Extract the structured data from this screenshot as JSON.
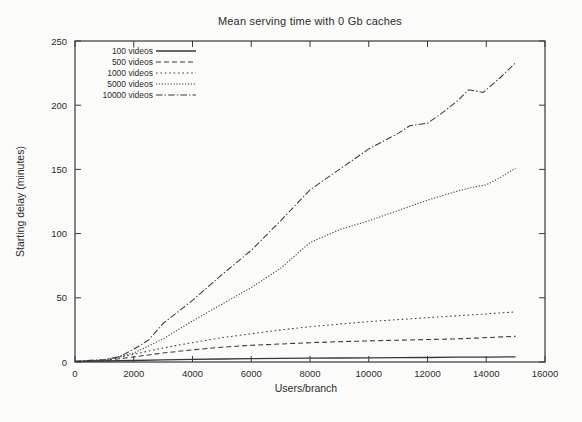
{
  "chart_data": {
    "type": "line",
    "title": "Mean serving time with 0 Gb caches",
    "xlabel": "Users/branch",
    "ylabel": "Starting delay (minutes)",
    "xlim": [
      0,
      16000
    ],
    "ylim": [
      0,
      250
    ],
    "x_ticks": [
      0,
      2000,
      4000,
      6000,
      8000,
      10000,
      12000,
      14000,
      16000
    ],
    "y_ticks": [
      0,
      50,
      100,
      150,
      200,
      250
    ],
    "grid": false,
    "legend_position": "top-left-inside",
    "line_color": "#383838",
    "text_color": "#2b2b2b",
    "series": [
      {
        "name": "100 videos",
        "dash": "solid",
        "points": [
          [
            0,
            0.5
          ],
          [
            1000,
            0.8
          ],
          [
            2000,
            1.2
          ],
          [
            3000,
            1.6
          ],
          [
            4000,
            2
          ],
          [
            5000,
            2.3
          ],
          [
            6000,
            2.6
          ],
          [
            7000,
            2.8
          ],
          [
            8000,
            3
          ],
          [
            9000,
            3.1
          ],
          [
            10000,
            3.2
          ],
          [
            11000,
            3.4
          ],
          [
            12000,
            3.5
          ],
          [
            13000,
            3.7
          ],
          [
            14000,
            3.8
          ],
          [
            15000,
            4
          ]
        ]
      },
      {
        "name": "500 videos",
        "dash": "dash",
        "points": [
          [
            0,
            0.5
          ],
          [
            1000,
            1
          ],
          [
            2000,
            4
          ],
          [
            3000,
            7
          ],
          [
            4000,
            9.5
          ],
          [
            5000,
            11.5
          ],
          [
            6000,
            13
          ],
          [
            7000,
            14
          ],
          [
            8000,
            15
          ],
          [
            9000,
            15.8
          ],
          [
            10000,
            16.4
          ],
          [
            11000,
            17
          ],
          [
            12000,
            17.5
          ],
          [
            13000,
            18
          ],
          [
            14000,
            19
          ],
          [
            15000,
            20
          ]
        ]
      },
      {
        "name": "1000 videos",
        "dash": "dot",
        "points": [
          [
            0,
            0.5
          ],
          [
            1000,
            1
          ],
          [
            2000,
            6
          ],
          [
            3000,
            11
          ],
          [
            4000,
            15
          ],
          [
            5000,
            19
          ],
          [
            6000,
            22
          ],
          [
            7000,
            25
          ],
          [
            8000,
            27.5
          ],
          [
            9000,
            29.5
          ],
          [
            10000,
            31.5
          ],
          [
            11000,
            33
          ],
          [
            12000,
            34.5
          ],
          [
            13000,
            36
          ],
          [
            14000,
            37.5
          ],
          [
            15000,
            39
          ]
        ]
      },
      {
        "name": "5000 videos",
        "dash": "fine-dot",
        "points": [
          [
            0,
            0.5
          ],
          [
            1000,
            1.5
          ],
          [
            2000,
            7
          ],
          [
            3000,
            18
          ],
          [
            4000,
            32
          ],
          [
            5000,
            45
          ],
          [
            6000,
            58
          ],
          [
            7000,
            73
          ],
          [
            8000,
            93
          ],
          [
            9000,
            103
          ],
          [
            10000,
            110
          ],
          [
            11000,
            118
          ],
          [
            12000,
            126
          ],
          [
            13000,
            133
          ],
          [
            13500,
            136
          ],
          [
            14000,
            138
          ],
          [
            14500,
            144
          ],
          [
            15000,
            151
          ]
        ]
      },
      {
        "name": "10000 videos",
        "dash": "dash-dot",
        "points": [
          [
            0,
            0.5
          ],
          [
            1000,
            2
          ],
          [
            1500,
            4
          ],
          [
            2000,
            10
          ],
          [
            2500,
            17
          ],
          [
            3000,
            30
          ],
          [
            4000,
            48
          ],
          [
            5000,
            68
          ],
          [
            6000,
            87
          ],
          [
            7000,
            110
          ],
          [
            8000,
            134
          ],
          [
            9000,
            150
          ],
          [
            10000,
            166
          ],
          [
            11000,
            178
          ],
          [
            11400,
            184
          ],
          [
            12000,
            186
          ],
          [
            12500,
            194
          ],
          [
            13000,
            203
          ],
          [
            13400,
            212
          ],
          [
            13900,
            210
          ],
          [
            14500,
            222
          ],
          [
            15000,
            233
          ]
        ]
      }
    ]
  }
}
